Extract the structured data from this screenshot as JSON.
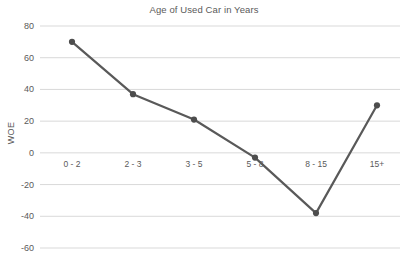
{
  "chart_data": {
    "type": "line",
    "title": "Age of Used Car in Years",
    "xlabel": "",
    "ylabel": "WOE",
    "categories": [
      "0 - 2",
      "2 - 3",
      "3 - 5",
      "5 - 8",
      "8 - 15",
      "15+"
    ],
    "values": [
      70,
      37,
      21,
      -3,
      -38,
      30
    ],
    "series": [
      {
        "name": "WOE",
        "values": [
          70,
          37,
          21,
          -3,
          -38,
          30
        ]
      }
    ],
    "ylim": [
      -60,
      80
    ],
    "yticks": [
      80,
      60,
      40,
      20,
      0,
      -20,
      -40,
      -60
    ],
    "ytick_labels": [
      "80",
      "60",
      "40",
      "20",
      "0",
      "-20",
      "-40",
      "-60"
    ],
    "grid": true,
    "grid_axis": "y",
    "legend": false,
    "legend_position": "none",
    "markers": true,
    "colors": {
      "line": "#595959",
      "marker": "#4d4d4d",
      "grid": "#d9d9d9",
      "text": "#5a5a5a",
      "background": "#ffffff"
    }
  }
}
